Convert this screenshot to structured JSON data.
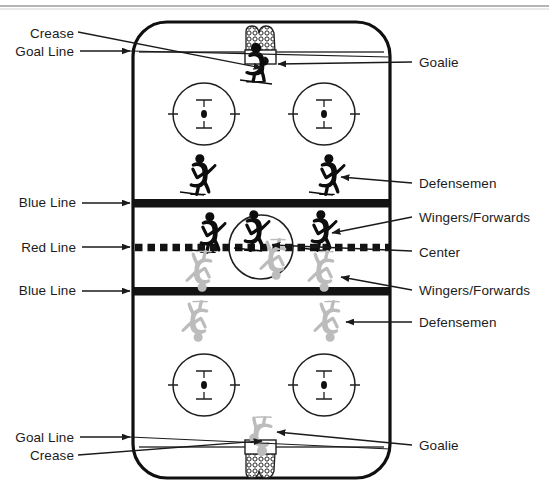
{
  "figure": {
    "background_color": "#ffffff",
    "ink_color": "#1a1a1a",
    "away_team_color": "#0d0d0d",
    "home_team_color": "#b9b9b9"
  },
  "rink": {
    "surface_color": "#ffffff",
    "board_color": "#101010",
    "left": 133,
    "right": 390,
    "top": 22,
    "bottom": 478,
    "corner_radius": 34
  },
  "markings": {
    "blue_line_color": "#141414",
    "red_line_color": "#141414",
    "goal_line_color": "#3a3a3a",
    "faceoff_circle_color": "#1f1f1f",
    "blue_line_top_y": 203,
    "red_line_y": 247,
    "blue_line_bottom_y": 291,
    "goal_line_top_y": 52,
    "goal_line_bottom_y": 447,
    "center_circle_radius": 32
  },
  "faceoff_circles": [
    {
      "name": "top-left-faceoff-circle",
      "cx": 204,
      "cy": 114,
      "r": 31
    },
    {
      "name": "top-right-faceoff-circle",
      "cx": 324,
      "cy": 114,
      "r": 31
    },
    {
      "name": "bottom-left-faceoff-circle",
      "cx": 204,
      "cy": 385,
      "r": 31
    },
    {
      "name": "bottom-right-faceoff-circle",
      "cx": 324,
      "cy": 385,
      "r": 31
    }
  ],
  "goals": [
    {
      "name": "top-goal-net",
      "cx": 261,
      "cy": 44,
      "team": "away"
    },
    {
      "name": "bottom-goal-net",
      "cx": 261,
      "cy": 456,
      "team": "home"
    }
  ],
  "players": [
    {
      "name": "away-goalie",
      "role": "Goalie",
      "team": "away",
      "x": 256,
      "y": 60
    },
    {
      "name": "away-defenseman-left",
      "role": "Defensemen",
      "team": "away",
      "x": 196,
      "y": 173
    },
    {
      "name": "away-defenseman-right",
      "role": "Defensemen",
      "team": "away",
      "x": 325,
      "y": 173
    },
    {
      "name": "away-winger-left",
      "role": "Wingers/Forwards",
      "team": "away",
      "x": 206,
      "y": 230
    },
    {
      "name": "away-center",
      "role": "Center",
      "team": "away",
      "x": 250,
      "y": 228
    },
    {
      "name": "away-winger-right",
      "role": "Wingers/Forwards",
      "team": "away",
      "x": 317,
      "y": 228
    },
    {
      "name": "home-center",
      "role": "Center",
      "team": "home",
      "x": 274,
      "y": 256
    },
    {
      "name": "home-winger-left",
      "role": "Wingers/Forwards",
      "team": "home",
      "x": 200,
      "y": 268
    },
    {
      "name": "home-winger-right",
      "role": "Wingers/Forwards",
      "team": "home",
      "x": 322,
      "y": 268
    },
    {
      "name": "home-defenseman-left",
      "role": "Defensemen",
      "team": "home",
      "x": 196,
      "y": 318
    },
    {
      "name": "home-defenseman-right",
      "role": "Defensemen",
      "team": "home",
      "x": 328,
      "y": 318
    },
    {
      "name": "home-goalie",
      "role": "Goalie",
      "team": "home",
      "x": 262,
      "y": 434
    }
  ],
  "labels_left": [
    {
      "name": "label-crease-top",
      "text": "Crease",
      "x": 22,
      "y": 26
    },
    {
      "name": "label-goal-line-top",
      "text": "Goal Line",
      "x": 9,
      "y": 44
    },
    {
      "name": "label-blue-line-top",
      "text": "Blue Line",
      "x": 14,
      "y": 195
    },
    {
      "name": "label-red-line",
      "text": "Red Line",
      "x": 17,
      "y": 240
    },
    {
      "name": "label-blue-line-bottom",
      "text": "Blue Line",
      "x": 14,
      "y": 283
    },
    {
      "name": "label-goal-line-bottom",
      "text": "Goal Line",
      "x": 9,
      "y": 430
    },
    {
      "name": "label-crease-bottom",
      "text": "Crease",
      "x": 22,
      "y": 448
    }
  ],
  "labels_right": [
    {
      "name": "label-goalie-top",
      "text": "Goalie",
      "x": 418,
      "y": 55
    },
    {
      "name": "label-defensemen-top",
      "text": "Defensemen",
      "x": 418,
      "y": 176
    },
    {
      "name": "label-wingers-forwards-top",
      "text": "Wingers/Forwards",
      "x": 418,
      "y": 210
    },
    {
      "name": "label-center",
      "text": "Center",
      "x": 418,
      "y": 245
    },
    {
      "name": "label-wingers-forwards-bottom",
      "text": "Wingers/Forwards",
      "x": 418,
      "y": 283
    },
    {
      "name": "label-defensemen-bottom",
      "text": "Defensemen",
      "x": 418,
      "y": 315
    },
    {
      "name": "label-goalie-bottom",
      "text": "Goalie",
      "x": 418,
      "y": 438
    }
  ],
  "top_rule": {
    "name": "top-border-rule",
    "y": 6,
    "color": "#5a5a5a"
  }
}
